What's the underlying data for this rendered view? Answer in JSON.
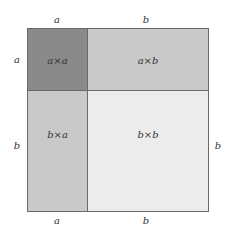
{
  "diagram": {
    "title": "",
    "top_labels": [
      "a",
      "b"
    ],
    "bottom_labels": [
      "a",
      "b"
    ],
    "left_labels": [
      "a",
      "b"
    ],
    "right_label": "b",
    "cells": [
      {
        "id": "aa",
        "label": "a×a",
        "color": "#8a8a8a"
      },
      {
        "id": "ab",
        "label": "a×b",
        "color": "#c9c9c9"
      },
      {
        "id": "ba",
        "label": "b×a",
        "color": "#c9c9c9"
      },
      {
        "id": "bb",
        "label": "b×b",
        "color": "#ececec"
      }
    ]
  }
}
